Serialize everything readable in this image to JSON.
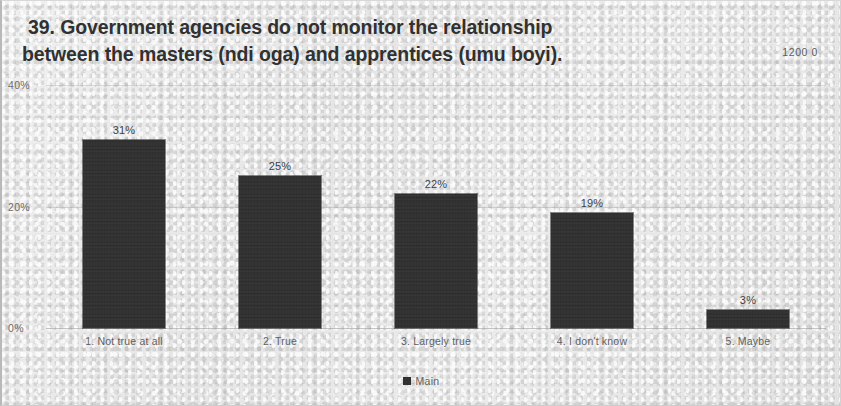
{
  "title": {
    "line1": "39. Government agencies do not monitor the relationship",
    "line2": "between the masters (ndi oga) and apprentices (umu boyi)."
  },
  "corner_note": "1200 0",
  "legend": {
    "marker": "square-marker",
    "label": "Main"
  },
  "axis": {
    "y_ticks": [
      "40%",
      "20%",
      "0%"
    ],
    "y_tick_40": "40%",
    "y_tick_20": "20%",
    "y_tick_0": "0%"
  },
  "colors": {
    "bar": "#2e2e2e",
    "background": "#e9e9e9",
    "text": "#5e5e5e",
    "title": "#2e2e2e",
    "gridline": "#aaaaaa"
  },
  "chart_data": {
    "type": "bar",
    "title": "39. Government agencies do not monitor the relationship between the masters (ndi oga) and apprentices (umu boyi).",
    "xlabel": "",
    "ylabel": "",
    "ylim": [
      0,
      40
    ],
    "y_unit": "%",
    "grid": true,
    "legend_position": "bottom",
    "categories": [
      "1. Not true at all",
      "2. True",
      "3. Largely true",
      "4. I don't know",
      "5. Maybe"
    ],
    "series": [
      {
        "name": "Main",
        "values": [
          31,
          25,
          22,
          19,
          3
        ],
        "labels": [
          "31%",
          "25%",
          "22%",
          "19%",
          "3%"
        ]
      }
    ]
  }
}
